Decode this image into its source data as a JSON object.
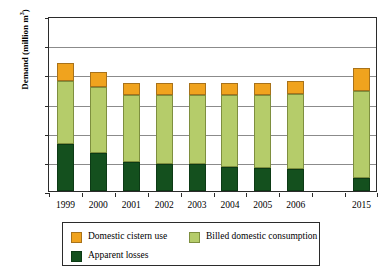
{
  "chart_data": {
    "type": "bar",
    "stacked": true,
    "title": "",
    "xlabel": "",
    "ylabel": "Demand (million m3)",
    "ylabel_text": "Demand (million m",
    "ylabel_sup": "3",
    "ylabel_tail": ")",
    "categories": [
      "1999",
      "2000",
      "2001",
      "2002",
      "2003",
      "2004",
      "2005",
      "2006",
      "",
      "2015"
    ],
    "ylim": [
      0,
      30
    ],
    "yticks": [
      0,
      5,
      10,
      15,
      20,
      25,
      30
    ],
    "ytick_labels": [
      "0",
      "5",
      "10",
      "15",
      "20",
      "25",
      "30"
    ],
    "grid": "horizontal",
    "legend_position": "below",
    "series": [
      {
        "name": "Apparent losses",
        "color": "#14501e",
        "values": [
          8.0,
          6.5,
          5.0,
          4.7,
          4.6,
          4.2,
          4.0,
          3.8,
          null,
          2.3
        ]
      },
      {
        "name": "Billed domestic consumption",
        "color": "#b5cc6a",
        "values": [
          10.9,
          11.3,
          11.4,
          11.7,
          11.8,
          12.2,
          12.4,
          12.8,
          null,
          14.9
        ]
      },
      {
        "name": "Domestic cistern use",
        "color": "#f0a31e",
        "values": [
          3.1,
          2.6,
          2.1,
          2.1,
          2.1,
          2.1,
          2.1,
          2.3,
          null,
          3.9
        ]
      }
    ],
    "totals": [
      22.0,
      20.4,
      18.5,
      18.5,
      18.5,
      18.5,
      18.5,
      18.9,
      null,
      21.1
    ],
    "legend_entries": [
      {
        "label": "Domestic cistern use",
        "color": "#f0a31e"
      },
      {
        "label": "Billed domestic consumption",
        "color": "#b5cc6a"
      },
      {
        "label": "Apparent losses",
        "color": "#14501e"
      }
    ]
  }
}
